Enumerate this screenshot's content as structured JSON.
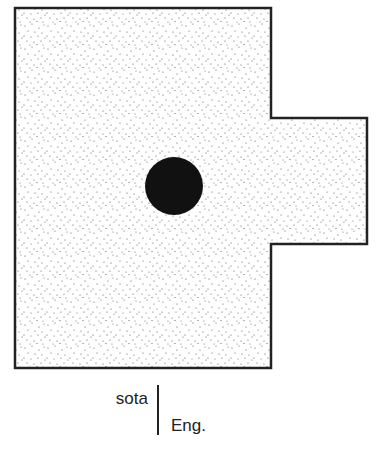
{
  "diagram": {
    "shape": {
      "type": "rectangle-with-right-tab",
      "fill_pattern": "stipple",
      "fill_color": "#ffffff",
      "dot_color": "#444444",
      "outline_color": "#222222",
      "main_rect": {
        "x": 15,
        "y": 8,
        "width": 256,
        "height": 360
      },
      "tab_rect": {
        "x": 271,
        "y": 118,
        "width": 96,
        "height": 126
      }
    },
    "marker": {
      "type": "circle",
      "color": "#111111",
      "cx": 174,
      "cy": 186,
      "r": 29
    }
  },
  "labels": {
    "top": "sota",
    "bottom": "Eng."
  }
}
